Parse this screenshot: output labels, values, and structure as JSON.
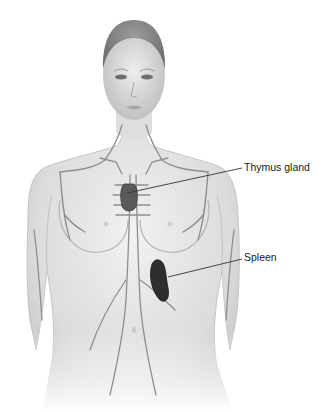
{
  "diagram": {
    "labels": [
      {
        "text": "Thymus gland",
        "x": 244,
        "y": 161,
        "target": {
          "x": 127,
          "y": 193
        },
        "line_start": {
          "x": 242,
          "y": 168
        }
      },
      {
        "text": "Spleen",
        "x": 244,
        "y": 251,
        "target": {
          "x": 168,
          "y": 277
        },
        "line_start": {
          "x": 242,
          "y": 259
        }
      }
    ],
    "colors": {
      "skin": "#e6e6e6",
      "skin_shadow": "#b9b9b9",
      "lymph_vessel": "#8e8e8e",
      "thymus": "#555555",
      "spleen": "#2e2e2e",
      "leader_line": "#333333",
      "label_text": "#1a1a1a"
    }
  }
}
